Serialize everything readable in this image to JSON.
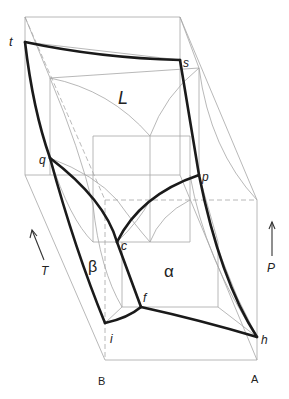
{
  "figure": {
    "type": "3D P-T-X phase diagram (binary system A-B)",
    "phase_regions": {
      "liquid": "L",
      "alpha": "α",
      "beta": "β"
    },
    "points": {
      "t": "t",
      "s": "s",
      "q": "q",
      "p": "p",
      "c": "c",
      "f": "f",
      "i": "i",
      "h": "h"
    },
    "components": {
      "left": "B",
      "right": "A"
    },
    "axes": {
      "temperature": "T",
      "pressure": "P"
    },
    "colors": {
      "phase_boundary": "#1a1a1a",
      "construction_lines": "#a6a6a6"
    }
  }
}
